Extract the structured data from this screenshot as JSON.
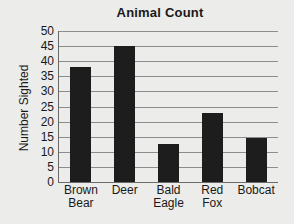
{
  "chart_data": {
    "type": "bar",
    "title": "Animal Count",
    "xlabel": "",
    "ylabel": "Number Sighted",
    "categories": [
      "Brown Bear",
      "Deer",
      "Bald Eagle",
      "Red Fox",
      "Bobcat"
    ],
    "category_lines": [
      [
        "Brown",
        "Bear"
      ],
      [
        "Deer"
      ],
      [
        "Bald",
        "Eagle"
      ],
      [
        "Red",
        "Fox"
      ],
      [
        "Bobcat"
      ]
    ],
    "values": [
      38,
      45,
      12.5,
      23,
      14.5
    ],
    "ylim": [
      0,
      50
    ],
    "ytick_step": 5,
    "yticks": [
      0,
      5,
      10,
      15,
      20,
      25,
      30,
      35,
      40,
      45,
      50
    ],
    "ytick_labels": [
      "0",
      "5",
      "10",
      "15",
      "20",
      "25",
      "30",
      "35",
      "40",
      "45",
      "50"
    ],
    "grid": true,
    "legend": false,
    "bar_color": "#1d1d1d",
    "gridline_color": "#8d8d8d",
    "axis_color": "#6a6a6a",
    "background_color": "#ececea",
    "text_color": "#191919"
  }
}
